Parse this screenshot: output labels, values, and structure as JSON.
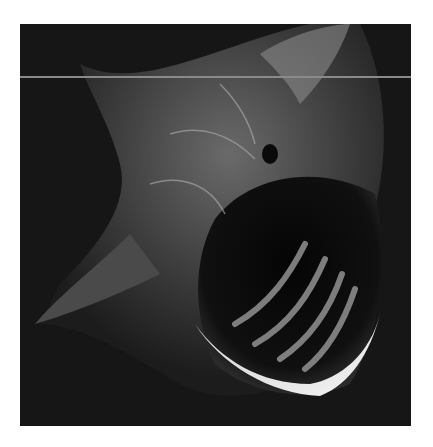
{
  "image": {
    "subject": "basking shark with mouth open underwater",
    "style": "black-and-white photograph",
    "background_color": "#161616",
    "page_color": "#ffffff"
  }
}
